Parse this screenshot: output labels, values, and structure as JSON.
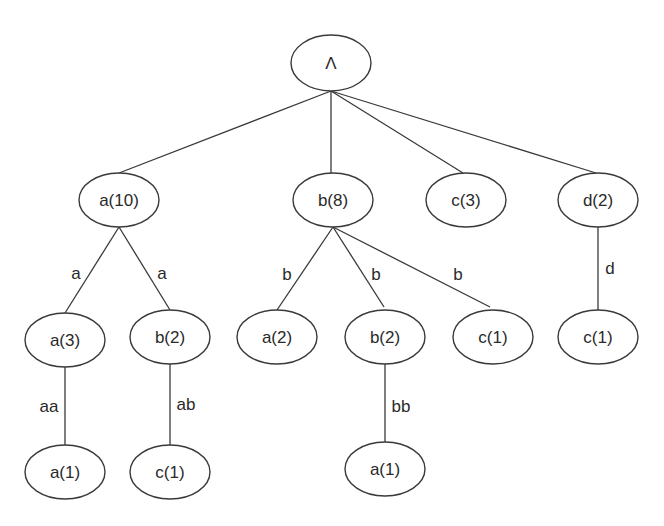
{
  "diagram": {
    "type": "tree",
    "colors": {
      "line": "#3a3a3a",
      "text": "#2a2a2a",
      "background": "#ffffff"
    },
    "nodes": [
      {
        "id": "root",
        "label": "Λ",
        "cx": 331,
        "cy": 63,
        "rx": 40,
        "ry": 28
      },
      {
        "id": "a10",
        "label": "a(10)",
        "cx": 119,
        "cy": 200,
        "rx": 40,
        "ry": 27
      },
      {
        "id": "b8",
        "label": "b(8)",
        "cx": 333,
        "cy": 200,
        "rx": 40,
        "ry": 27
      },
      {
        "id": "c3",
        "label": "c(3)",
        "cx": 466,
        "cy": 200,
        "rx": 40,
        "ry": 27
      },
      {
        "id": "d2",
        "label": "d(2)",
        "cx": 598,
        "cy": 200,
        "rx": 40,
        "ry": 27
      },
      {
        "id": "a3",
        "label": "a(3)",
        "cx": 65,
        "cy": 340,
        "rx": 40,
        "ry": 27
      },
      {
        "id": "ab2",
        "label": "b(2)",
        "cx": 170,
        "cy": 337,
        "rx": 40,
        "ry": 27
      },
      {
        "id": "ba2",
        "label": "a(2)",
        "cx": 277,
        "cy": 337,
        "rx": 40,
        "ry": 27
      },
      {
        "id": "bb2",
        "label": "b(2)",
        "cx": 385,
        "cy": 337,
        "rx": 40,
        "ry": 27
      },
      {
        "id": "bc1",
        "label": "c(1)",
        "cx": 493,
        "cy": 337,
        "rx": 40,
        "ry": 27
      },
      {
        "id": "dc1",
        "label": "c(1)",
        "cx": 598,
        "cy": 337,
        "rx": 40,
        "ry": 27
      },
      {
        "id": "aaa1",
        "label": "a(1)",
        "cx": 65,
        "cy": 472,
        "rx": 40,
        "ry": 27
      },
      {
        "id": "abc1",
        "label": "c(1)",
        "cx": 170,
        "cy": 472,
        "rx": 40,
        "ry": 27
      },
      {
        "id": "bba1",
        "label": "a(1)",
        "cx": 385,
        "cy": 469,
        "rx": 40,
        "ry": 27
      }
    ],
    "edges": [
      {
        "from": "root",
        "to": "a10",
        "label": "",
        "x1": 331,
        "y1": 91,
        "x2": 119,
        "y2": 173
      },
      {
        "from": "root",
        "to": "b8",
        "label": "",
        "x1": 331,
        "y1": 91,
        "x2": 331,
        "y2": 173
      },
      {
        "from": "root",
        "to": "c3",
        "label": "",
        "x1": 331,
        "y1": 91,
        "x2": 463,
        "y2": 173
      },
      {
        "from": "root",
        "to": "d2",
        "label": "",
        "x1": 331,
        "y1": 91,
        "x2": 596,
        "y2": 173
      },
      {
        "from": "a10",
        "to": "a3",
        "label": "a",
        "x1": 119,
        "y1": 227,
        "x2": 65,
        "y2": 313,
        "lx": 76,
        "ly": 273
      },
      {
        "from": "a10",
        "to": "ab2",
        "label": "a",
        "x1": 119,
        "y1": 227,
        "x2": 170,
        "y2": 310,
        "lx": 162,
        "ly": 273
      },
      {
        "from": "b8",
        "to": "ba2",
        "label": "b",
        "x1": 333,
        "y1": 227,
        "x2": 277,
        "y2": 310,
        "lx": 287,
        "ly": 274
      },
      {
        "from": "b8",
        "to": "bb2",
        "label": "b",
        "x1": 333,
        "y1": 227,
        "x2": 384,
        "y2": 307,
        "lx": 376,
        "ly": 274
      },
      {
        "from": "b8",
        "to": "bc1",
        "label": "b",
        "x1": 333,
        "y1": 227,
        "x2": 490,
        "y2": 307,
        "lx": 458,
        "ly": 274
      },
      {
        "from": "d2",
        "to": "dc1",
        "label": "d",
        "x1": 598,
        "y1": 227,
        "x2": 598,
        "y2": 310,
        "lx": 610,
        "ly": 268
      },
      {
        "from": "a3",
        "to": "aaa1",
        "label": "aa",
        "x1": 65,
        "y1": 367,
        "x2": 65,
        "y2": 445,
        "lx": 49,
        "ly": 406
      },
      {
        "from": "ab2",
        "to": "abc1",
        "label": "ab",
        "x1": 170,
        "y1": 364,
        "x2": 170,
        "y2": 445,
        "lx": 186,
        "ly": 404
      },
      {
        "from": "bb2",
        "to": "bba1",
        "label": "bb",
        "x1": 385,
        "y1": 364,
        "x2": 385,
        "y2": 442,
        "lx": 401,
        "ly": 406
      }
    ]
  }
}
